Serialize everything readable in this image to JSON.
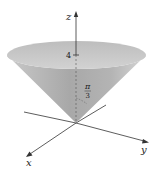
{
  "figure": {
    "axes": {
      "x_label": "x",
      "y_label": "y",
      "z_label": "z"
    },
    "annotations": {
      "height_label": "4",
      "angle_numerator": "π",
      "angle_denominator": "3"
    },
    "colors": {
      "cone_light": "#d4d4d4",
      "cone_dark": "#9a9a9a",
      "rim": "#c8c8c8",
      "axis": "#333333"
    }
  }
}
